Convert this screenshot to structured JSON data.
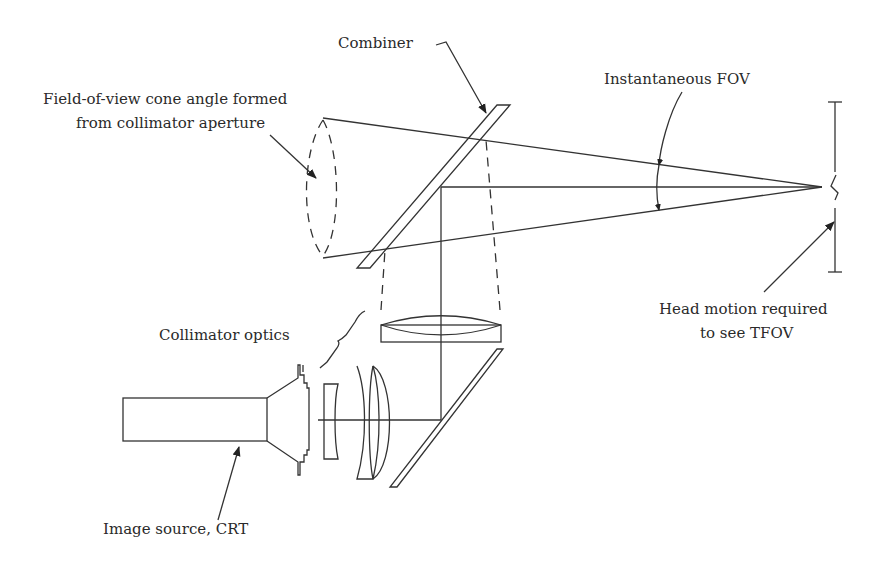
{
  "diagram": {
    "labels": {
      "combiner": "Combiner",
      "fov_cone_line1": "Field-of-view cone angle formed",
      "fov_cone_line2": "from collimator aperture",
      "instantaneous_fov": "Instantaneous FOV",
      "head_motion_line1": "Head motion required",
      "head_motion_line2": "to see TFOV",
      "collimator_optics": "Collimator optics",
      "image_source": "Image source, CRT"
    },
    "colors": {
      "line": "#333333",
      "text": "#2a2a2a",
      "background": "#ffffff"
    }
  }
}
